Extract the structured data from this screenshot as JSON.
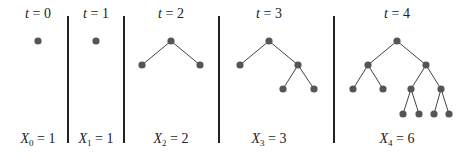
{
  "panels": [
    {
      "t_label": "t",
      "t_value": "0",
      "x_label": "X",
      "x_sub": "0",
      "x_value": "1",
      "cx": 38
    },
    {
      "t_label": "t",
      "t_value": "1",
      "x_label": "X",
      "x_sub": "1",
      "x_value": "1",
      "cx": 96
    },
    {
      "t_label": "t",
      "t_value": "2",
      "x_label": "X",
      "x_sub": "2",
      "x_value": "2",
      "cx": 171
    },
    {
      "t_label": "t",
      "t_value": "3",
      "x_label": "X",
      "x_sub": "3",
      "x_value": "3",
      "cx": 269
    },
    {
      "t_label": "t",
      "t_value": "4",
      "x_label": "X",
      "x_sub": "4",
      "x_value": "6",
      "cx": 397
    }
  ],
  "dividers_x": [
    68,
    124,
    219,
    334
  ],
  "colors": {
    "node": "#555555",
    "edge": "#444444",
    "divider": "#222222"
  },
  "trees": [
    {
      "nodes": [
        [
          38,
          41
        ]
      ],
      "edges": []
    },
    {
      "nodes": [
        [
          96,
          41
        ]
      ],
      "edges": []
    },
    {
      "nodes": [
        [
          171,
          41
        ],
        [
          142,
          65
        ],
        [
          200,
          65
        ]
      ],
      "edges": [
        [
          0,
          1
        ],
        [
          0,
          2
        ]
      ]
    },
    {
      "nodes": [
        [
          269,
          41
        ],
        [
          240,
          65
        ],
        [
          298,
          65
        ],
        [
          283,
          89
        ],
        [
          314,
          89
        ]
      ],
      "edges": [
        [
          0,
          1
        ],
        [
          0,
          2
        ],
        [
          2,
          3
        ],
        [
          2,
          4
        ]
      ]
    },
    {
      "nodes": [
        [
          397,
          41
        ],
        [
          368,
          65
        ],
        [
          426,
          65
        ],
        [
          353,
          89
        ],
        [
          383,
          89
        ],
        [
          411,
          89
        ],
        [
          441,
          89
        ],
        [
          403,
          114
        ],
        [
          419,
          114
        ],
        [
          434,
          114
        ],
        [
          449,
          114
        ]
      ],
      "edges": [
        [
          0,
          1
        ],
        [
          0,
          2
        ],
        [
          1,
          3
        ],
        [
          1,
          4
        ],
        [
          2,
          5
        ],
        [
          2,
          6
        ],
        [
          5,
          7
        ],
        [
          5,
          8
        ],
        [
          6,
          9
        ],
        [
          6,
          10
        ]
      ]
    }
  ]
}
